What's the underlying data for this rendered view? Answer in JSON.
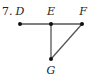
{
  "problem": {
    "number": "7.",
    "points": [
      {
        "name": "D",
        "x": 20,
        "y": 24,
        "label_x": 20,
        "label_y": 15
      },
      {
        "name": "E",
        "x": 51,
        "y": 24,
        "label_x": 51,
        "label_y": 15
      },
      {
        "name": "F",
        "x": 82,
        "y": 24,
        "label_x": 83,
        "label_y": 15
      },
      {
        "name": "G",
        "x": 51,
        "y": 59,
        "label_x": 51,
        "label_y": 74
      }
    ],
    "segments": [
      {
        "from": "D",
        "to": "F"
      },
      {
        "from": "E",
        "to": "G"
      },
      {
        "from": "F",
        "to": "G"
      }
    ],
    "colors": {
      "line": "#555555",
      "point": "#111111",
      "text": "#222222"
    }
  }
}
